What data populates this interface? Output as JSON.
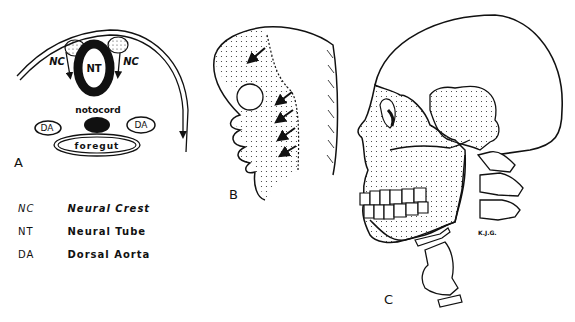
{
  "figure": {
    "panels": [
      {
        "id": "A",
        "label": "A",
        "description": "Cross-section of embryo showing neural crest migration",
        "labels": {
          "nc_left": "NC",
          "nc_right": "NC",
          "nt": "NT",
          "notocord": "notocord",
          "da_left": "DA",
          "da_right": "DA",
          "foregut": "foregut"
        }
      },
      {
        "id": "B",
        "label": "B",
        "description": "Lateral view of embryonic head with pharyngeal arches and migration arrows"
      },
      {
        "id": "C",
        "label": "C",
        "description": "Lateral view of adult skull with neural-crest-derived regions stippled",
        "signature": "K.J.G."
      }
    ],
    "legend": [
      {
        "abbr": "NC",
        "text": "Neural Crest",
        "italic": true
      },
      {
        "abbr": "NT",
        "text": "Neural Tube",
        "italic": false
      },
      {
        "abbr": "DA",
        "text": "Dorsal Aorta",
        "italic": false
      }
    ]
  }
}
